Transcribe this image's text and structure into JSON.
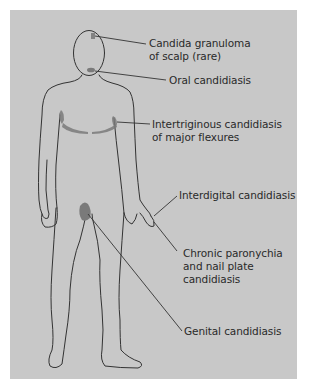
{
  "diagram": {
    "type": "anatomical-body-map",
    "background_color": "#c8c8c8",
    "lesion_color": "#7a7a7a",
    "outline_color": "#333333",
    "labels": [
      {
        "id": "scalp",
        "lines": [
          "Candida granuloma",
          "of scalp (rare)"
        ]
      },
      {
        "id": "oral",
        "lines": [
          "Oral candidiasis"
        ]
      },
      {
        "id": "intertriginous",
        "lines": [
          "Intertriginous candidiasis",
          "of major flexures"
        ]
      },
      {
        "id": "interdigital",
        "lines": [
          "Interdigital candidiasis"
        ]
      },
      {
        "id": "paronychia",
        "lines": [
          "Chronic paronychia",
          "and nail plate",
          "candidiasis"
        ]
      },
      {
        "id": "genital",
        "lines": [
          "Genital candidiasis"
        ]
      }
    ]
  }
}
